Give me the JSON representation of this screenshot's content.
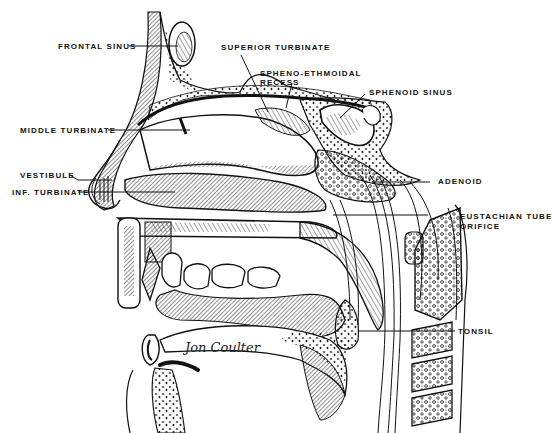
{
  "figure": {
    "signature": "Jon Coulter",
    "colors": {
      "ink": "#111111",
      "paper": "#ffffff",
      "shade": "#555555"
    }
  },
  "labels": [
    {
      "id": "frontal-sinus",
      "text": "FRONTAL SINUS"
    },
    {
      "id": "superior-turbinate",
      "text": "SUPERIOR TURBINATE"
    },
    {
      "id": "spheno-ethmoidal-recess-1",
      "text": "SPHENO-ETHMOIDAL"
    },
    {
      "id": "spheno-ethmoidal-recess-2",
      "text": "RECESS"
    },
    {
      "id": "sphenoid-sinus",
      "text": "SPHENOID SINUS"
    },
    {
      "id": "middle-turbinate",
      "text": "MIDDLE TURBINATE"
    },
    {
      "id": "adenoid",
      "text": "ADENOID"
    },
    {
      "id": "vestibule",
      "text": "VESTIBULE"
    },
    {
      "id": "inf-turbinate",
      "text": "INF. TURBINATE"
    },
    {
      "id": "eustachian-tube-1",
      "text": "EUSTACHIAN TUBE"
    },
    {
      "id": "eustachian-tube-2",
      "text": "ORIFICE"
    },
    {
      "id": "tonsil",
      "text": "TONSIL"
    }
  ]
}
